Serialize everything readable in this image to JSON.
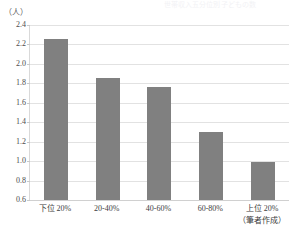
{
  "ghost_title": "世帯収入五分位別 子どもの数",
  "axis_unit_label": "（人）",
  "source_note": "（筆者作成）",
  "colors": {
    "bar": "#808080",
    "gridline": "#e2e2e2",
    "axis": "#d9d9d9",
    "tick_text": "#4d4d4d",
    "category_text": "#3d3d3d"
  },
  "chart_data": {
    "type": "bar",
    "title": "",
    "subtitle": "",
    "xlabel": "",
    "ylabel": "（人）",
    "ylim": [
      0.6,
      2.4
    ],
    "ytick_step": 0.2,
    "ytick_labels": [
      "2.4",
      "2.2",
      "2.0",
      "1.8",
      "1.6",
      "1.4",
      "1.2",
      "1.0",
      "0.8",
      "0.6"
    ],
    "ytick_values": [
      2.4,
      2.2,
      2.0,
      1.8,
      1.6,
      1.4,
      1.2,
      1.0,
      0.8,
      0.6
    ],
    "grid": true,
    "legend": false,
    "legend_position": "none",
    "categories": [
      "下位 20%",
      "20-40%",
      "40-60%",
      "60-80%",
      "上位 20%"
    ],
    "values": [
      2.26,
      1.85,
      1.76,
      1.3,
      0.99
    ],
    "annotations": [
      "（筆者作成）"
    ]
  }
}
